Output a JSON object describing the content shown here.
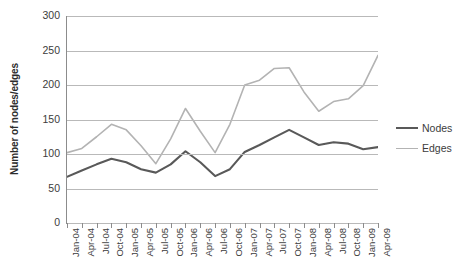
{
  "chart_data": {
    "type": "line",
    "title": "",
    "xlabel": "",
    "ylabel": "Number of nodes/edges",
    "ylim": [
      0,
      300
    ],
    "ytick_step": 50,
    "yticks": [
      0,
      50,
      100,
      150,
      200,
      250,
      300
    ],
    "grid": true,
    "legend_position": "right",
    "categories": [
      "Jan-04",
      "Apr-04",
      "Jul-04",
      "Oct-04",
      "Jan-05",
      "Apr-05",
      "Jul-05",
      "Oct-05",
      "Jan-06",
      "Apr-06",
      "Jul-06",
      "Oct-06",
      "Jan-07",
      "Apr-07",
      "Jul-07",
      "Oct-07",
      "Jan-08",
      "Apr-08",
      "Jul-08",
      "Oct-08",
      "Jan-09",
      "Apr-09"
    ],
    "series": [
      {
        "name": "Nodes",
        "color": "#595959",
        "values": [
          67,
          76,
          85,
          93,
          88,
          78,
          73,
          85,
          104,
          88,
          68,
          78,
          103,
          113,
          124,
          135,
          124,
          113,
          117,
          115,
          107,
          110
        ]
      },
      {
        "name": "Edges",
        "color": "#b3b3b3",
        "values": [
          102,
          108,
          125,
          143,
          135,
          112,
          86,
          122,
          166,
          133,
          102,
          143,
          200,
          207,
          224,
          225,
          190,
          162,
          176,
          180,
          199,
          243
        ]
      }
    ]
  },
  "legend": {
    "items": [
      {
        "label": "Nodes"
      },
      {
        "label": "Edges"
      }
    ]
  },
  "axes": {
    "y_title": "Number of nodes/edges"
  }
}
